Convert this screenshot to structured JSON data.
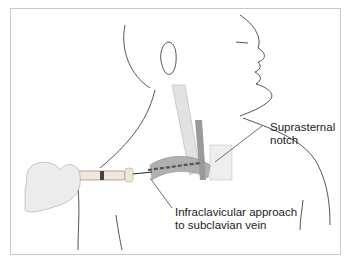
{
  "figure": {
    "labels": {
      "suprasternal_line1": "Suprasternal",
      "suprasternal_line2": "notch",
      "approach_line1": "Infraclavicular approach",
      "approach_line2": "to subclavian vein"
    },
    "colors": {
      "outline": "#2a2a2a",
      "muscle": "#d8d8d8",
      "vein": "#9a9a9a",
      "needle_path": "#555555",
      "frame": "#c8c8c8"
    }
  }
}
